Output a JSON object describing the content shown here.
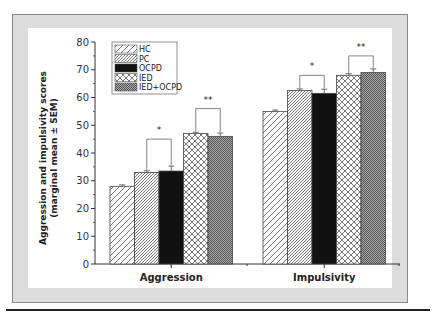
{
  "chart_data": {
    "type": "bar",
    "title": "",
    "xlabel": "",
    "ylabel": "Aggression and impulsivity scores",
    "ylabel_sub": "(marginal mean ± SEM)",
    "ylim": [
      0,
      80
    ],
    "yticks": [
      0,
      10,
      20,
      30,
      40,
      50,
      60,
      70,
      80
    ],
    "categories": [
      "Aggression",
      "Impulsivity"
    ],
    "legend_position": "top-left",
    "series": [
      {
        "name": "HC",
        "pattern": "sparse-diagonal",
        "values": [
          28,
          55
        ],
        "sem": [
          0.5,
          0.5
        ]
      },
      {
        "name": "PC",
        "pattern": "dense-diagonal",
        "values": [
          33,
          62.5
        ],
        "sem": [
          0.6,
          0.6
        ]
      },
      {
        "name": "OCPD",
        "pattern": "solid-black",
        "values": [
          33.5,
          61.5
        ],
        "sem": [
          1.8,
          1.5
        ]
      },
      {
        "name": "IED",
        "pattern": "crosshatch",
        "values": [
          47,
          68
        ],
        "sem": [
          0.5,
          0.6
        ]
      },
      {
        "name": "IED+OCPD",
        "pattern": "fine-grid",
        "values": [
          46,
          69
        ],
        "sem": [
          1.2,
          1.3
        ]
      }
    ],
    "annotations": [
      {
        "category": "Aggression",
        "between": [
          "PC",
          "OCPD"
        ],
        "text": "*",
        "bracket_top": 45
      },
      {
        "category": "Aggression",
        "between": [
          "IED",
          "IED+OCPD"
        ],
        "text": "**",
        "bracket_top": 56
      },
      {
        "category": "Impulsivity",
        "between": [
          "PC",
          "OCPD"
        ],
        "text": "*",
        "bracket_top": 68
      },
      {
        "category": "Impulsivity",
        "between": [
          "IED",
          "IED+OCPD"
        ],
        "text": "**",
        "bracket_top": 75
      }
    ]
  }
}
